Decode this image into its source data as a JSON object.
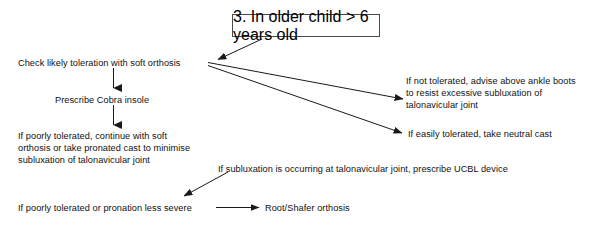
{
  "figure": {
    "title_box": {
      "label": "3. In older child > 6 years old"
    },
    "nodes": {
      "check_toleration": "Check likely toleration with soft orthosis",
      "prescribe_cobra": "Prescribe Cobra insole",
      "poorly_tolerated_l1": "If poorly tolerated, continue with soft",
      "poorly_tolerated_l2": "orthosis or take pronated cast to minimise",
      "poorly_tolerated_l3": "subluxation of talonavicular joint",
      "not_tolerated_l1": "If not tolerated, advise above ankle boots",
      "not_tolerated_l2": "to resist excessive subluxation of",
      "not_tolerated_l3": "talonavicular joint",
      "easily_tolerated": "If easily tolerated, take neutral cast",
      "subluxation_ucbl": "If subluxation is occurring at talonavicular joint, prescribe UCBL device",
      "poorly_tolerated_or_pronation": "If poorly tolerated or pronation less severe",
      "root_shafer": "Root/Shafer orthosis"
    },
    "colors": {
      "line": "#1a1a1a",
      "box_border": "#4a4a4a",
      "text": "#111111",
      "background": "#ffffff"
    }
  }
}
